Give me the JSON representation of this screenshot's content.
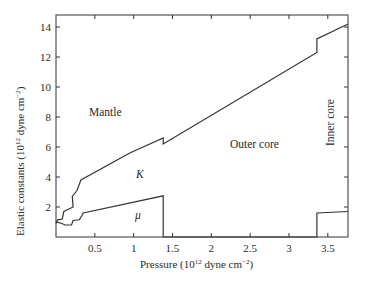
{
  "chart_data": {
    "type": "line",
    "title": "",
    "xlabel": "Pressure (10^12 dyne cm^-2)",
    "ylabel": "Elastic constants (10^12 dyne cm^-2)",
    "xlim": [
      0,
      3.76
    ],
    "ylim": [
      0,
      14.8
    ],
    "grid": false,
    "legend": "none (inline series labels)",
    "x_ticks": [
      0.5,
      1,
      1.5,
      2,
      2.5,
      3,
      3.5
    ],
    "x_tick_labels": [
      "0.5",
      "1",
      "1.5",
      "2",
      "2.5",
      "3",
      "3.5"
    ],
    "y_ticks": [
      2,
      4,
      6,
      8,
      10,
      12,
      14
    ],
    "y_tick_labels": [
      "2",
      "4",
      "6",
      "8",
      "10",
      "12",
      "14"
    ],
    "series": [
      {
        "name": "K",
        "label": "K",
        "points": [
          [
            0.0,
            0.9
          ],
          [
            0.02,
            1.15
          ],
          [
            0.08,
            1.2
          ],
          [
            0.1,
            1.7
          ],
          [
            0.22,
            2.0
          ],
          [
            0.21,
            2.7
          ],
          [
            0.27,
            3.1
          ],
          [
            0.32,
            3.8
          ],
          [
            0.95,
            5.6
          ],
          [
            1.38,
            6.6
          ],
          [
            1.38,
            6.2
          ],
          [
            3.36,
            12.3
          ],
          [
            3.36,
            13.2
          ],
          [
            3.76,
            14.2
          ]
        ]
      },
      {
        "name": "mu",
        "label": "μ",
        "points": [
          [
            0.0,
            1.0
          ],
          [
            0.05,
            0.95
          ],
          [
            0.12,
            0.8
          ],
          [
            0.2,
            0.8
          ],
          [
            0.22,
            1.1
          ],
          [
            0.3,
            1.15
          ],
          [
            0.33,
            1.4
          ],
          [
            0.35,
            1.6
          ],
          [
            1.38,
            2.75
          ],
          [
            1.38,
            0.0
          ],
          [
            3.36,
            0.0
          ],
          [
            3.36,
            1.6
          ],
          [
            3.76,
            1.7
          ]
        ]
      }
    ],
    "annotations": [
      {
        "text": "Mantle",
        "x": 0.55,
        "y": 8.2
      },
      {
        "text": "Outer core",
        "x": 2.35,
        "y": 6.2
      },
      {
        "text": "Inner core",
        "x": 3.5,
        "y": 8.6,
        "rotation": -90
      },
      {
        "text": "K",
        "x": 1.1,
        "y": 4.2
      },
      {
        "text": "μ",
        "x": 1.07,
        "y": 1.5
      }
    ],
    "region_boundaries": [
      1.38,
      3.36
    ]
  },
  "labels": {
    "mantle": "Mantle",
    "outer_core": "Outer core",
    "inner_core": "Inner core",
    "k": "K",
    "mu": "μ",
    "x_axis": "Pressure (10",
    "x_axis_exp": "12",
    "x_axis_rest": " dyne cm",
    "x_axis_exp2": "−2",
    "x_axis_close": ")",
    "y_axis": "Elastic constants (10",
    "y_axis_exp": "12",
    "y_axis_rest": " dyne cm",
    "y_axis_exp2": "−2",
    "y_axis_close": ")"
  }
}
